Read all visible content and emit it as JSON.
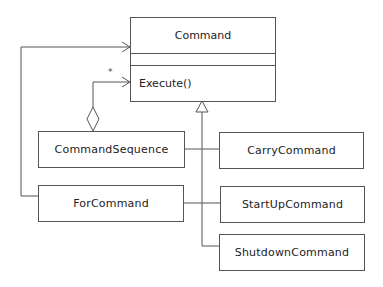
{
  "diagram": {
    "type": "UML class diagram",
    "classes": {
      "command": {
        "name": "Command",
        "operation": "Execute()"
      },
      "command_sequence": {
        "name": "CommandSequence"
      },
      "for_command": {
        "name": "ForCommand"
      },
      "carry_command": {
        "name": "CarryCommand"
      },
      "startup_command": {
        "name": "StartUpCommand"
      },
      "shutdown_command": {
        "name": "ShutdownCommand"
      }
    },
    "multiplicity": "*",
    "colors": {
      "line": "#555555",
      "text": "#222222",
      "background": "#ffffff"
    }
  }
}
